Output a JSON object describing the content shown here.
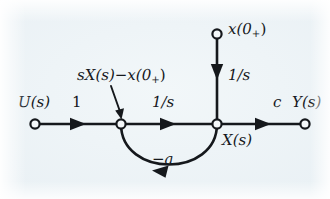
{
  "figure": {
    "kind": "signal-flow-graph",
    "colors": {
      "ink": "#15181c",
      "paper": "#eef3f6"
    },
    "nodes": [
      {
        "id": "input",
        "label": "U(s)",
        "label_sub": "",
        "type": "source",
        "x": 35,
        "y": 124
      },
      {
        "id": "sum",
        "label": "",
        "type": "mixed",
        "x": 121,
        "y": 124
      },
      {
        "id": "state",
        "label": "X(s)",
        "type": "mixed",
        "x": 217,
        "y": 124
      },
      {
        "id": "initial",
        "label": "x(0",
        "type": "source",
        "x": 217,
        "y": 34
      },
      {
        "id": "output",
        "label": "Y(s)",
        "type": "sink",
        "x": 305,
        "y": 124
      }
    ],
    "node_labels": {
      "input": "U(s)",
      "output": "Y(s)",
      "state": "X(s)",
      "initial_main": "x(0",
      "initial_sub": "+",
      "initial_close": ")"
    },
    "branch_gains": {
      "input_to_sum": "1",
      "sum_to_state": "1/s",
      "initial_to_state": "1/s",
      "state_to_output": "c",
      "feedback": "−a"
    },
    "callout": {
      "main_a": "sX(s)",
      "minus": "−",
      "main_b": "x(0",
      "sub": "+",
      "close": ")"
    }
  }
}
